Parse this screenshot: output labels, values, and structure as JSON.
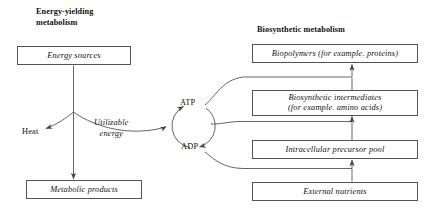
{
  "figure": {
    "title_left": "Energy-yielding\nmetabolism",
    "title_right": "Biosynthetic metabolism"
  },
  "nodes": {
    "energy_sources": "Energy sources",
    "metabolic_products": "Metabolic products",
    "biopolymers": "Biopolymers (for example. proteins)",
    "biosynthetic_intermediates": "Biosynthetic intermediates\n(for example. amino acids)",
    "intracellular_precursor_pool": "Intracellular precursor pool",
    "external_nutrients": "External nutrients"
  },
  "labels": {
    "heat": "Heat",
    "atp": "ATP",
    "adp": "ADP",
    "utilizable_energy": "Utilizable\nenergy"
  },
  "colors": {
    "stroke": "#555555",
    "text": "#111111",
    "background": "#ffffff"
  }
}
